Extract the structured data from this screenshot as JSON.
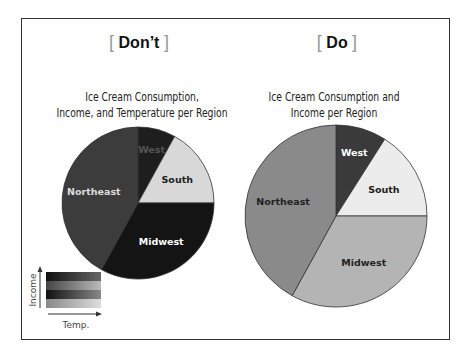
{
  "headers": {
    "dont": "Don’t",
    "do": "Do",
    "bracket_open": "[",
    "bracket_close": "]"
  },
  "chart_data": [
    {
      "type": "pie",
      "panel": "Don't",
      "title": "Ice Cream Consumption, Income, and Temperature per Region",
      "title_lines": [
        "Ice Cream Consumption,",
        "Income, and Temperature per Region"
      ],
      "categories": [
        "West",
        "South",
        "Midwest",
        "Northeast"
      ],
      "values": [
        8,
        17,
        33,
        42
      ],
      "colors": [
        "#1e1e1e",
        "#d8d8d8",
        "#141414",
        "#3c3c3c"
      ],
      "legend": {
        "type": "2D color key",
        "xlabel": "Temp.",
        "ylabel": "Income"
      }
    },
    {
      "type": "pie",
      "panel": "Do",
      "title": "Ice Cream Consumption and Income per Region",
      "title_lines": [
        "Ice Cream Consumption and",
        "Income per Region"
      ],
      "categories": [
        "West",
        "South",
        "Midwest",
        "Northeast"
      ],
      "values": [
        9,
        16,
        33,
        42
      ],
      "colors": [
        "#3a3a3a",
        "#ececec",
        "#b4b4b4",
        "#8a8a8a"
      ]
    }
  ],
  "legend": {
    "xlabel": "Temp.",
    "ylabel": "Income"
  }
}
